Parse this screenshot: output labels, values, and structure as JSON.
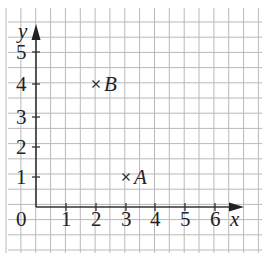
{
  "diagram": {
    "type": "coordinate-grid",
    "axes": {
      "x_label": "x",
      "y_label": "y",
      "x_ticks": [
        "1",
        "2",
        "3",
        "4",
        "5",
        "6"
      ],
      "y_ticks": [
        "1",
        "2",
        "3",
        "4",
        "5"
      ],
      "origin_label": "0"
    },
    "points": [
      {
        "label": "A",
        "x": 3,
        "y": 1,
        "marker": "×"
      },
      {
        "label": "B",
        "x": 2,
        "y": 4,
        "marker": "×"
      }
    ],
    "colors": {
      "grid": "#b9b9b9",
      "axis": "#333333",
      "text": "#222222"
    }
  }
}
